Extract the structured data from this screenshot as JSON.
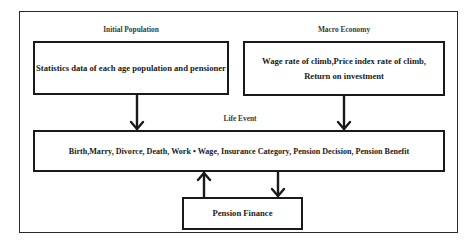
{
  "diagram": {
    "sections": {
      "initial_population": {
        "label": "Initial Population",
        "box_text": "Statistics data of each age population and pensioner"
      },
      "macro_economy": {
        "label": "Macro Economy",
        "box_lines": [
          "Wage rate of climb,Price index rate of climb,",
          "Return on investment"
        ]
      },
      "life_event": {
        "label": "Life Event",
        "box_text": "Birth,Marry, Divorce, Death, Work • Wage, Insurance Category, Pension Decision, Pension Benefit"
      },
      "pension_finance": {
        "box_text": "Pension Finance"
      }
    },
    "edges": [
      {
        "from": "Initial Population",
        "to": "Life Event",
        "direction": "down"
      },
      {
        "from": "Macro Economy",
        "to": "Life Event",
        "direction": "down"
      },
      {
        "from": "Pension Finance",
        "to": "Life Event",
        "direction": "up"
      },
      {
        "from": "Life Event",
        "to": "Pension Finance",
        "direction": "down"
      }
    ],
    "colors": {
      "stroke": "#1a1a1a",
      "background": "#ffffff"
    }
  }
}
